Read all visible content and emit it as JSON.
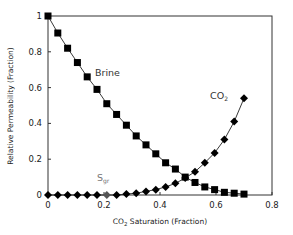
{
  "chart_data": {
    "type": "line",
    "title": "",
    "xlabel": "CO2 Saturation (Fraction)",
    "xlabel_parts": {
      "main": "CO",
      "sub": "2",
      "rest": " Saturation (Fraction)"
    },
    "ylabel": "Relative Permeability (Fraction)",
    "xlim": [
      0,
      0.8
    ],
    "ylim": [
      0,
      1
    ],
    "xticks": [
      0,
      0.2,
      0.4,
      0.6,
      0.8
    ],
    "xtick_labels": [
      "0",
      "0.2",
      "0.4",
      "0.6",
      "0.8"
    ],
    "yticks": [
      0,
      0.2,
      0.4,
      0.6,
      0.8,
      1
    ],
    "ytick_labels": [
      "0",
      "0.2",
      "0.4",
      "0.6",
      "0.8",
      "1"
    ],
    "grid": false,
    "legend": "none (inline labels)",
    "x": [
      0,
      0.035,
      0.07,
      0.105,
      0.14,
      0.175,
      0.21,
      0.245,
      0.28,
      0.315,
      0.35,
      0.385,
      0.42,
      0.455,
      0.49,
      0.525,
      0.56,
      0.595,
      0.63,
      0.665,
      0.7
    ],
    "series": [
      {
        "name": "Brine",
        "marker": "square",
        "color": "#000000",
        "values": [
          1.0,
          0.905,
          0.82,
          0.74,
          0.66,
          0.59,
          0.51,
          0.45,
          0.39,
          0.33,
          0.28,
          0.23,
          0.18,
          0.145,
          0.1,
          0.07,
          0.045,
          0.03,
          0.015,
          0.01,
          0.005
        ]
      },
      {
        "name": "CO2",
        "marker": "diamond",
        "color": "#000000",
        "values": [
          0,
          0,
          0,
          0,
          0,
          0,
          0,
          0,
          0.005,
          0.01,
          0.02,
          0.03,
          0.045,
          0.065,
          0.095,
          0.13,
          0.18,
          0.235,
          0.31,
          0.41,
          0.54
        ]
      }
    ],
    "annotations": [
      {
        "text": "Brine",
        "x": 0.17,
        "y": 0.8
      },
      {
        "text": "CO2",
        "x": 0.62,
        "y": 0.56
      },
      {
        "text": "Sgr",
        "x": 0.19,
        "y": 0.06,
        "marker_x": 0.21
      }
    ]
  },
  "labels": {
    "brine": "Brine",
    "co2_main": "CO",
    "co2_sub": "2",
    "sgr_main": "S",
    "sgr_sub": "gr",
    "xlabel_main": "CO",
    "xlabel_sub": "2",
    "xlabel_rest": " Saturation (Fraction)",
    "ylabel": "Relative Permeability (Fraction)"
  }
}
